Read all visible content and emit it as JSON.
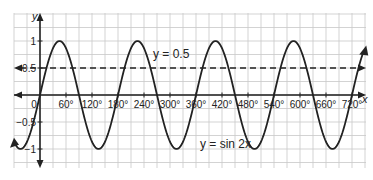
{
  "chart_data": {
    "type": "line",
    "title": "",
    "xlabel": "x",
    "ylabel": "y",
    "x_unit": "degrees",
    "xlim": [
      -100,
      750
    ],
    "ylim": [
      -1.5,
      1.5
    ],
    "grid": true,
    "x_ticks": [
      0,
      60,
      120,
      180,
      240,
      300,
      360,
      420,
      480,
      540,
      600,
      660,
      720
    ],
    "x_tick_labels": [
      "0",
      "60°",
      "120°",
      "180°",
      "240°",
      "300°",
      "360°",
      "420°",
      "480°",
      "540°",
      "600°",
      "660°",
      "720°"
    ],
    "y_ticks": [
      -1,
      -0.5,
      0.5,
      1
    ],
    "y_tick_labels": [
      "−1",
      "−0.5",
      "0.5",
      "1"
    ],
    "series": [
      {
        "name": "y = sin 2x",
        "style": "solid",
        "function": "sin(2x)",
        "x": [
          -90,
          -45,
          0,
          45,
          90,
          135,
          180,
          225,
          270,
          315,
          360,
          405,
          450,
          495,
          540,
          585,
          630,
          675,
          720,
          745
        ],
        "values": [
          0,
          -1,
          0,
          1,
          0,
          -1,
          0,
          1,
          0,
          -1,
          0,
          1,
          0,
          -1,
          0,
          1,
          0,
          -1,
          0,
          0.77
        ]
      },
      {
        "name": "y = 0.5",
        "style": "dashed",
        "function": "0.5",
        "x": [
          -100,
          750
        ],
        "values": [
          0.5,
          0.5
        ]
      }
    ],
    "annotations": [
      {
        "text": "y = 0.5",
        "x": 255,
        "y": 0.72
      },
      {
        "text": "y = sin 2x",
        "x": 520,
        "y": -1.05
      }
    ],
    "legend": "none"
  },
  "labels": {
    "x_axis": "x",
    "y_axis": "y",
    "line_label": "y = 0.5",
    "curve_label": "y = sin 2x",
    "origin": "0"
  }
}
